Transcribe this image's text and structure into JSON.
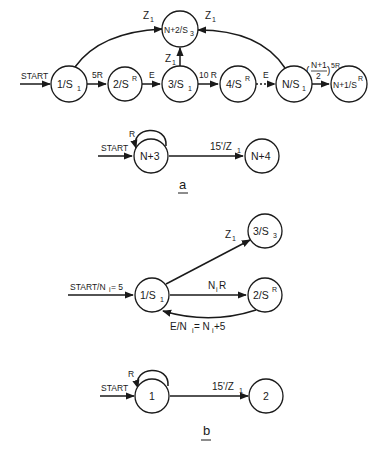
{
  "figure": {
    "part_a": {
      "label": "a",
      "main_chain": {
        "nodes": [
          {
            "id": "n1",
            "label": "1/S",
            "sub": "1",
            "sup": ""
          },
          {
            "id": "n2",
            "label": "2/S",
            "sub": "",
            "sup": "R"
          },
          {
            "id": "n3",
            "label": "3/S",
            "sub": "1",
            "sup": ""
          },
          {
            "id": "n4",
            "label": "4/S",
            "sub": "",
            "sup": "R"
          },
          {
            "id": "nN",
            "label": "N/S",
            "sub": "1",
            "sup": ""
          },
          {
            "id": "nN1",
            "label": "N+1/S",
            "sub": "",
            "sup": "R"
          },
          {
            "id": "nN2",
            "label": "N+2/S",
            "sub": "3",
            "sup": ""
          }
        ],
        "edges": [
          {
            "from": "start",
            "to": "n1",
            "label": "START"
          },
          {
            "from": "n1",
            "to": "n2",
            "label": "5R"
          },
          {
            "from": "n2",
            "to": "n3",
            "label": "E"
          },
          {
            "from": "n3",
            "to": "n4",
            "label": "10 R"
          },
          {
            "from": "n4",
            "to": "nN",
            "label": "E",
            "style": "dotted"
          },
          {
            "from": "nN",
            "to": "nN1",
            "label": "(N+1/2)5R",
            "frac_num": "N+1",
            "frac_den": "2",
            "frac_suffix": "5R"
          },
          {
            "from": "n1",
            "to": "nN2",
            "label": "Z",
            "sub": "1"
          },
          {
            "from": "n3",
            "to": "nN2",
            "label": "Z",
            "sub": "1"
          },
          {
            "from": "nN",
            "to": "nN2",
            "label": "Z",
            "sub": "1"
          }
        ]
      },
      "timer_chain": {
        "nodes": [
          {
            "id": "t1",
            "label": "N+3"
          },
          {
            "id": "t2",
            "label": "N+4"
          }
        ],
        "edges": [
          {
            "from": "start",
            "to": "t1",
            "label": "START"
          },
          {
            "from": "t1",
            "to": "t1",
            "label": "R",
            "type": "self-loop"
          },
          {
            "from": "t1",
            "to": "t2",
            "label": "15'/Z",
            "sub": "1"
          }
        ]
      }
    },
    "part_b": {
      "label": "b",
      "main_chain": {
        "nodes": [
          {
            "id": "b1",
            "label": "1/S",
            "sub": "1",
            "sup": ""
          },
          {
            "id": "b2",
            "label": "2/S",
            "sub": "",
            "sup": "R"
          },
          {
            "id": "b3",
            "label": "3/S",
            "sub": "3",
            "sup": ""
          }
        ],
        "edges": [
          {
            "from": "start",
            "to": "b1",
            "label": "START/N",
            "sub": "i",
            "suffix": " = 5"
          },
          {
            "from": "b1",
            "to": "b2",
            "label": "N",
            "sub": "i",
            "suffix": "R"
          },
          {
            "from": "b2",
            "to": "b1",
            "label": "E/N",
            "sub": "i",
            "suffix": " = N",
            "sub2": "i",
            "suffix2": "+5"
          },
          {
            "from": "b1",
            "to": "b3",
            "label": "Z",
            "sub": "1"
          }
        ]
      },
      "timer_chain": {
        "nodes": [
          {
            "id": "bt1",
            "label": "1"
          },
          {
            "id": "bt2",
            "label": "2"
          }
        ],
        "edges": [
          {
            "from": "start",
            "to": "bt1",
            "label": "START"
          },
          {
            "from": "bt1",
            "to": "bt1",
            "label": "R",
            "type": "self-loop"
          },
          {
            "from": "bt1",
            "to": "bt2",
            "label": "15'/Z",
            "sub": "1"
          }
        ]
      }
    }
  }
}
